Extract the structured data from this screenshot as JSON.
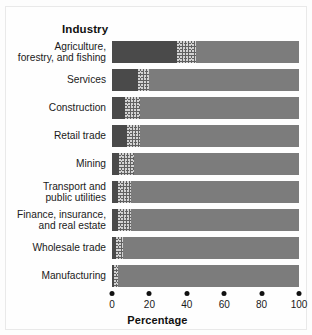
{
  "header": {
    "industry_title": "Industry"
  },
  "axis": {
    "title": "Percentage",
    "ticks": [
      {
        "value": 0,
        "label": "0"
      },
      {
        "value": 20,
        "label": "20"
      },
      {
        "value": 40,
        "label": "40"
      },
      {
        "value": 60,
        "label": "60"
      },
      {
        "value": 80,
        "label": "80"
      },
      {
        "value": 100,
        "label": "100"
      }
    ]
  },
  "chart_data": {
    "type": "bar",
    "orientation": "horizontal",
    "stacked": true,
    "title": "Industry",
    "xlabel": "Percentage",
    "ylabel": "Industry",
    "xlim": [
      0,
      100
    ],
    "grid": false,
    "legend": null,
    "categories": [
      "Agriculture, forestry, and fishing",
      "Services",
      "Construction",
      "Retail trade",
      "Mining",
      "Transport and public utilities",
      "Finance, insurance, and real estate",
      "Wholesale trade",
      "Manufacturing"
    ],
    "category_lines": [
      [
        "Agriculture,",
        "forestry, and fishing"
      ],
      [
        "Services"
      ],
      [
        "Construction"
      ],
      [
        "Retail trade"
      ],
      [
        "Mining"
      ],
      [
        "Transport and",
        "public utilities"
      ],
      [
        "Finance, insurance,",
        "and real estate"
      ],
      [
        "Wholesale trade"
      ],
      [
        "Manufacturing"
      ]
    ],
    "series": [
      {
        "name": "dark-segment",
        "fill": "solid-dark",
        "color": "#4a4a4a",
        "values": [
          35,
          14,
          7,
          8,
          4,
          3,
          3,
          2,
          1
        ]
      },
      {
        "name": "stippled-segment",
        "fill": "stipple",
        "color": "#616161",
        "values": [
          10,
          6,
          8,
          7,
          8,
          7,
          7,
          4,
          2
        ]
      },
      {
        "name": "light-segment",
        "fill": "solid-light",
        "color": "#7c7c7c",
        "values": [
          55,
          80,
          85,
          85,
          88,
          90,
          90,
          94,
          97
        ]
      }
    ],
    "cumulative_boundaries": [
      [
        35,
        45
      ],
      [
        14,
        20
      ],
      [
        7,
        15
      ],
      [
        8,
        15
      ],
      [
        4,
        12
      ],
      [
        3,
        10
      ],
      [
        3,
        10
      ],
      [
        2,
        6
      ],
      [
        1,
        3
      ]
    ]
  }
}
